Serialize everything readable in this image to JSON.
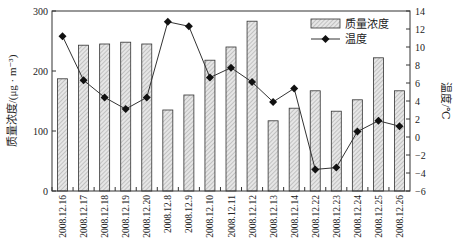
{
  "chart_data": {
    "type": "bar+line",
    "title": "",
    "categories": [
      "2008.12.16",
      "2008.12.17",
      "2008.12.18",
      "2008.12.19",
      "2008.12.20",
      "2008.12.8",
      "2008.12.9",
      "2008.12.10",
      "2008.12.11",
      "2008.12.12",
      "2008.12.13",
      "2008.12.14",
      "2008.12.22",
      "2008.12.23",
      "2008.12.24",
      "2008.12.25",
      "2008.12.26"
    ],
    "series": [
      {
        "name": "质量浓度",
        "type": "bar",
        "axis": "left",
        "values": [
          187,
          243,
          245,
          248,
          245,
          135,
          160,
          218,
          240,
          283,
          117,
          138,
          167,
          133,
          152,
          222,
          167
        ]
      },
      {
        "name": "温度",
        "type": "line",
        "axis": "right",
        "values": [
          11.2,
          6.3,
          4.4,
          3.1,
          4.4,
          12.8,
          12.3,
          6.6,
          7.7,
          6.1,
          3.9,
          5.4,
          -3.6,
          -3.4,
          0.6,
          1.8,
          1.2
        ]
      }
    ],
    "ylabel": "质量浓度/(μg · m⁻³)",
    "ylabel_right": "温度/℃",
    "xlabel": "",
    "ylim": [
      0,
      300
    ],
    "ylim_right": [
      -6,
      14
    ],
    "yticks": [
      0,
      100,
      200,
      300
    ],
    "yticks_right": [
      -6,
      -4,
      -2,
      0,
      2,
      4,
      6,
      8,
      10,
      12,
      14
    ],
    "grid": false,
    "legend_position": "top-right-inside"
  },
  "legend": {
    "bar_label": "质量浓度",
    "line_label": "温度"
  },
  "axes": {
    "left_title": "质量浓度/(μg · m⁻³)",
    "right_title": "温度/℃"
  }
}
